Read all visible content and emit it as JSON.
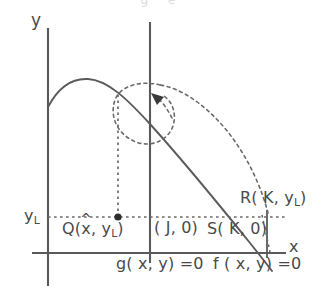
{
  "figure": {
    "type": "diagram",
    "axes": {
      "x_label": "x",
      "y_label": "y",
      "x_axis_y_px": 253,
      "y_axis_x_px": 48
    },
    "gridline_labels": {
      "y_level": "y",
      "y_level_sub": "L"
    },
    "points": [
      {
        "name": "point-q",
        "label_prefix": "Q(",
        "label_var": "x",
        "label_hat": "^",
        "label_mid": ", y",
        "label_sub": "L",
        "label_suffix": ")",
        "x_px": 118,
        "y_px": 217,
        "marked": true
      },
      {
        "name": "point-j",
        "label": "( J, 0)",
        "x_px": 150,
        "y_px": 253,
        "marked": false
      },
      {
        "name": "point-s",
        "label_prefix": "S( K, 0)",
        "x_px": 267,
        "y_px": 253,
        "marked": false
      },
      {
        "name": "point-r",
        "label_prefix": "R( K, y",
        "label_sub": "L",
        "label_suffix": ")",
        "x_px": 267,
        "y_px": 217,
        "marked": false
      }
    ],
    "curves": [
      {
        "name": "curve-f",
        "label_prefix": "f ( x, y) ",
        "label_suffix": "=0",
        "style": "solid"
      },
      {
        "name": "curve-g",
        "label_prefix": "g( x, y) ",
        "label_suffix": "=0",
        "style": "solid-vertical"
      },
      {
        "name": "trajectory",
        "style": "dashed",
        "has_arrow": true,
        "arrow_direction": "up-left"
      }
    ],
    "colors": {
      "line": "#5a5a5a",
      "dash": "#6b6b6b",
      "text": "#4a4a4a",
      "background": "#ffffff"
    },
    "top_cropped_text": "g        e"
  }
}
